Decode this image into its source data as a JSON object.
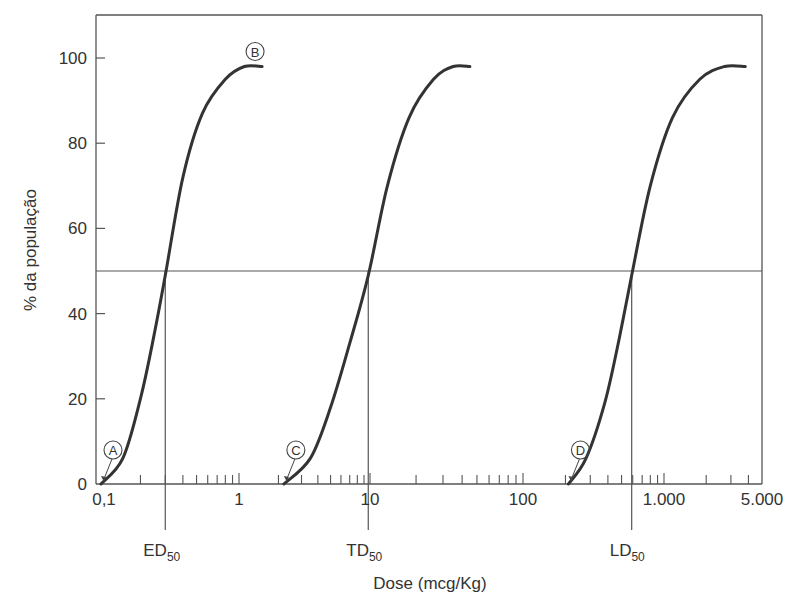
{
  "chart_data": {
    "type": "line",
    "title": "",
    "xlabel": "Dose (mcg/Kg)",
    "ylabel": "% da população",
    "xscale": "log",
    "xlim": [
      0.1,
      5000
    ],
    "ylim": [
      0,
      110
    ],
    "grid": false,
    "legend": "none",
    "x_ticks": [
      {
        "value": 0.1,
        "label": "0,1"
      },
      {
        "value": 1,
        "label": "1"
      },
      {
        "value": 10,
        "label": "10"
      },
      {
        "value": 100,
        "label": "100"
      },
      {
        "value": 1000,
        "label": "1.000"
      },
      {
        "value": 5000,
        "label": "5.000"
      }
    ],
    "y_ticks": [
      {
        "value": 0,
        "label": "0"
      },
      {
        "value": 20,
        "label": "20"
      },
      {
        "value": 40,
        "label": "40"
      },
      {
        "value": 60,
        "label": "60"
      },
      {
        "value": 80,
        "label": "80"
      },
      {
        "value": 100,
        "label": "100"
      }
    ],
    "reference_line": {
      "y": 50
    },
    "series": [
      {
        "name": "Efeito terapêutico",
        "start_label": "A",
        "end_label": "B",
        "x": [
          0.105,
          0.15,
          0.2,
          0.25,
          0.3,
          0.4,
          0.55,
          0.8,
          1.1,
          1.5
        ],
        "y": [
          0,
          6,
          20,
          35,
          49,
          72,
          87,
          95,
          98,
          98
        ]
      },
      {
        "name": "Efeito tóxico",
        "start_label": "C",
        "end_label": "",
        "x": [
          2.2,
          3.5,
          5,
          7,
          9.7,
          13,
          18,
          26,
          35,
          45
        ],
        "y": [
          0,
          6,
          18,
          33,
          49,
          70,
          86,
          95,
          98,
          98
        ]
      },
      {
        "name": "Efeito letal",
        "start_label": "D",
        "end_label": "",
        "x": [
          210,
          280,
          380,
          480,
          590,
          800,
          1150,
          1800,
          2700,
          3800
        ],
        "y": [
          0,
          6,
          19,
          34,
          49,
          70,
          86,
          95,
          98,
          98
        ]
      }
    ],
    "markers": [
      {
        "name": "ED",
        "sub": "50",
        "x": 0.3
      },
      {
        "name": "TD",
        "sub": "50",
        "x": 9.7
      },
      {
        "name": "LD",
        "sub": "50",
        "x": 590
      }
    ],
    "minor_ticks": [
      0.2,
      0.3,
      0.4,
      0.5,
      0.6,
      0.7,
      0.8,
      0.9,
      2,
      3,
      4,
      5,
      6,
      7,
      8,
      9,
      20,
      30,
      40,
      50,
      60,
      70,
      80,
      90,
      200,
      300,
      400,
      500,
      600,
      700,
      800,
      900,
      2000,
      3000,
      4000
    ]
  }
}
